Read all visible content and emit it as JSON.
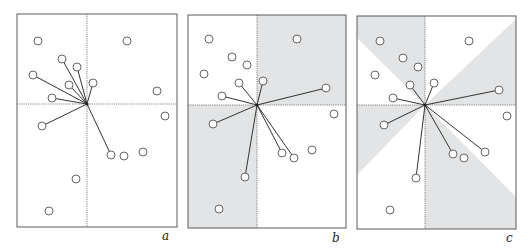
{
  "figure": {
    "panels": [
      {
        "label": "a",
        "frame": {
          "x": 17,
          "y": 14,
          "w": 160,
          "h": 213
        },
        "center": [
          87,
          104
        ],
        "label_pos": [
          162,
          240
        ],
        "shading": "none",
        "shade_polygons": [],
        "points": [
          [
            38,
            41
          ],
          [
            127,
            41
          ],
          [
            62,
            59
          ],
          [
            77,
            67
          ],
          [
            33,
            75
          ],
          [
            93,
            83
          ],
          [
            69,
            85
          ],
          [
            157,
            91
          ],
          [
            52,
            98
          ],
          [
            165,
            116
          ],
          [
            42,
            126
          ],
          [
            111,
            155
          ],
          [
            124,
            156
          ],
          [
            143,
            152
          ],
          [
            76,
            179
          ],
          [
            49,
            211
          ]
        ],
        "connected": [
          [
            62,
            59
          ],
          [
            77,
            67
          ],
          [
            33,
            75
          ],
          [
            93,
            83
          ],
          [
            69,
            85
          ],
          [
            52,
            98
          ],
          [
            42,
            126
          ],
          [
            111,
            155
          ]
        ]
      },
      {
        "label": "b",
        "frame": {
          "x": 188,
          "y": 15,
          "w": 158,
          "h": 213
        },
        "center": [
          257,
          105
        ],
        "label_pos": [
          332,
          242
        ],
        "shading": "quadrants",
        "shade_polygons": [
          [
            [
              257,
              15
            ],
            [
              346,
              15
            ],
            [
              346,
              105
            ],
            [
              257,
              105
            ]
          ],
          [
            [
              188,
              105
            ],
            [
              257,
              105
            ],
            [
              257,
              228
            ],
            [
              188,
              228
            ]
          ]
        ],
        "points": [
          [
            209,
            39
          ],
          [
            297,
            39
          ],
          [
            232,
            57
          ],
          [
            247,
            65
          ],
          [
            204,
            74
          ],
          [
            239,
            83
          ],
          [
            263,
            81
          ],
          [
            326,
            88
          ],
          [
            222,
            96
          ],
          [
            334,
            114
          ],
          [
            213,
            124
          ],
          [
            282,
            153
          ],
          [
            294,
            158
          ],
          [
            312,
            150
          ],
          [
            245,
            177
          ],
          [
            219,
            209
          ]
        ],
        "connected": [
          [
            239,
            83
          ],
          [
            263,
            81
          ],
          [
            326,
            88
          ],
          [
            222,
            96
          ],
          [
            213,
            124
          ],
          [
            282,
            153
          ],
          [
            294,
            158
          ],
          [
            245,
            177
          ]
        ]
      },
      {
        "label": "c",
        "frame": {
          "x": 357,
          "y": 16,
          "w": 159,
          "h": 213
        },
        "center": [
          425,
          105
        ],
        "label_pos": [
          506,
          242
        ],
        "shading": "octants",
        "shade_polygons": [
          [
            [
              357,
              16
            ],
            [
              425,
              16
            ],
            [
              425,
              105
            ],
            [
              357,
              38
            ]
          ],
          [
            [
              516,
              19
            ],
            [
              516,
              105
            ],
            [
              425,
              105
            ]
          ],
          [
            [
              357,
              105
            ],
            [
              425,
              105
            ],
            [
              357,
              175
            ]
          ],
          [
            [
              425,
              105
            ],
            [
              516,
              197
            ],
            [
              516,
              229
            ],
            [
              425,
              229
            ]
          ]
        ],
        "points": [
          [
            380,
            41
          ],
          [
            469,
            41
          ],
          [
            403,
            58
          ],
          [
            418,
            67
          ],
          [
            375,
            75
          ],
          [
            410,
            85
          ],
          [
            434,
            83
          ],
          [
            499,
            90
          ],
          [
            393,
            98
          ],
          [
            507,
            116
          ],
          [
            384,
            125
          ],
          [
            453,
            154
          ],
          [
            464,
            158
          ],
          [
            485,
            152
          ],
          [
            416,
            178
          ],
          [
            390,
            210
          ]
        ],
        "connected": [
          [
            410,
            85
          ],
          [
            434,
            83
          ],
          [
            499,
            90
          ],
          [
            393,
            98
          ],
          [
            384,
            125
          ],
          [
            453,
            154
          ],
          [
            485,
            152
          ],
          [
            416,
            178
          ]
        ]
      }
    ],
    "colors": {
      "shade": "#e2e4e6",
      "line": "#333333",
      "frame": "#5a5a5a"
    },
    "point_radius": 4
  }
}
